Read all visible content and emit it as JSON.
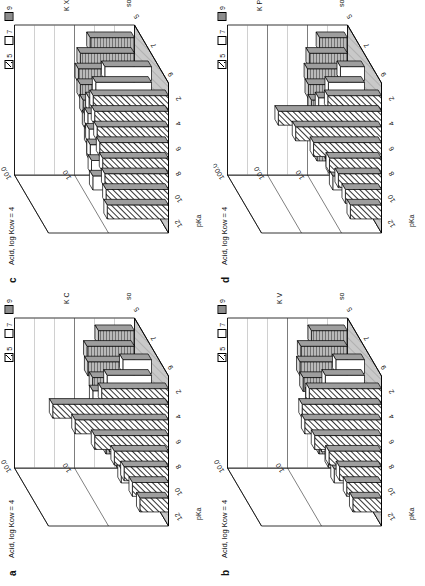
{
  "figure": {
    "rotation_deg": -90,
    "background": "#ffffff",
    "ink": "#111111"
  },
  "legend": {
    "title": "soil pH",
    "items": [
      {
        "label": "5",
        "pattern": "diagonal-hatch",
        "swatch": "#ffffff"
      },
      {
        "label": "7",
        "pattern": "solid-white",
        "swatch": "#ffffff"
      },
      {
        "label": "9",
        "pattern": "horizontal-hatch",
        "swatch": "#d9d9d9"
      }
    ]
  },
  "axes": {
    "pka_label": "pKa",
    "pka_ticks": [
      "12",
      "10",
      "8",
      "6",
      "4",
      "2"
    ],
    "ph_label": "soil pH",
    "ph_ticks": [
      "9",
      "7",
      "5"
    ]
  },
  "panels": [
    {
      "letter": "a",
      "title": "Acid, log Kow = 4",
      "zlabel": "K Cyt-soil",
      "z_ticks": [
        "10.0",
        "1.0",
        "0.1"
      ],
      "chart_data": {
        "type": "bar",
        "title": "Acid, log Kow = 4",
        "xlabel": "pKa",
        "ylabel": "K Cyt-soil",
        "zlabel": "soil pH",
        "categories": [
          "12",
          "10",
          "8",
          "6",
          "4",
          "2"
        ],
        "ylim": [
          0.1,
          10.0
        ],
        "log_scale": true,
        "grid": true,
        "legend_position": "top-right",
        "series": [
          {
            "name": "5",
            "pattern": "diagonal-hatch",
            "values": [
              0.3,
              0.4,
              0.55,
              0.8,
              1.7,
              3.6,
              8.5,
              1.3
            ]
          },
          {
            "name": "7",
            "pattern": "solid-white",
            "values": [
              0.32,
              0.38,
              0.5,
              0.7,
              0.9,
              0.95,
              0.55,
              0.3
            ]
          },
          {
            "name": "9",
            "pattern": "horizontal-hatch",
            "values": [
              0.3,
              0.33,
              0.36,
              0.4,
              0.5,
              0.6,
              0.62,
              0.4
            ]
          }
        ]
      }
    },
    {
      "letter": "b",
      "title": "Acid, log Kow = 4",
      "zlabel": "K Vac-soil",
      "z_ticks": [
        "10.0",
        "1.0",
        "0.1"
      ],
      "chart_data": {
        "type": "bar",
        "title": "Acid, log Kow = 4",
        "xlabel": "pKa",
        "ylabel": "K Vac-soil",
        "zlabel": "soil pH",
        "categories": [
          "12",
          "10",
          "8",
          "6",
          "4",
          "2"
        ],
        "ylim": [
          0.1,
          10.0
        ],
        "log_scale": true,
        "grid": true,
        "legend_position": "top-right",
        "series": [
          {
            "name": "5",
            "pattern": "diagonal-hatch",
            "values": [
              0.3,
              0.38,
              0.5,
              0.75,
              1.3,
              1.9,
              2.1,
              1.6
            ]
          },
          {
            "name": "7",
            "pattern": "solid-white",
            "values": [
              0.32,
              0.4,
              0.52,
              0.68,
              0.8,
              0.75,
              0.45,
              0.3
            ]
          },
          {
            "name": "9",
            "pattern": "horizontal-hatch",
            "values": [
              0.3,
              0.34,
              0.38,
              0.44,
              0.55,
              0.62,
              0.6,
              0.4
            ]
          }
        ]
      }
    },
    {
      "letter": "c",
      "title": "Acid, log Kow = 4",
      "zlabel": "K Xyl-soil",
      "z_ticks": [
        "10.0",
        "1.0",
        "0.1"
      ],
      "chart_data": {
        "type": "bar",
        "title": "Acid, log Kow = 4",
        "xlabel": "pKa",
        "ylabel": "K Xyl-soil",
        "zlabel": "soil pH",
        "categories": [
          "12",
          "10",
          "8",
          "6",
          "4",
          "2"
        ],
        "ylim": [
          0.1,
          10.0
        ],
        "log_scale": true,
        "grid": true,
        "legend_position": "top-right",
        "series": [
          {
            "name": "5",
            "pattern": "diagonal-hatch",
            "values": [
              1.05,
              1.1,
              1.15,
              1.25,
              1.4,
              1.55,
              1.7,
              1.8
            ]
          },
          {
            "name": "7",
            "pattern": "solid-white",
            "values": [
              0.95,
              1.0,
              1.05,
              1.1,
              1.15,
              1.1,
              0.85,
              0.6
            ]
          },
          {
            "name": "9",
            "pattern": "horizontal-hatch",
            "values": [
              0.55,
              0.6,
              0.65,
              0.72,
              0.8,
              0.86,
              0.8,
              0.55
            ]
          }
        ]
      }
    },
    {
      "letter": "d",
      "title": "Acid, log Kow = 4",
      "zlabel": "K Phlo-soil",
      "z_ticks": [
        "100.0",
        "10.0",
        "1.0",
        "0.1"
      ],
      "chart_data": {
        "type": "bar",
        "title": "Acid, log Kow = 4",
        "xlabel": "pKa",
        "ylabel": "K Phlo-soil",
        "zlabel": "soil pH",
        "categories": [
          "12",
          "10",
          "8",
          "6",
          "4",
          "2"
        ],
        "ylim": [
          0.1,
          100.0
        ],
        "log_scale": true,
        "grid": true,
        "legend_position": "top-right",
        "series": [
          {
            "name": "5",
            "pattern": "diagonal-hatch",
            "values": [
              0.6,
              0.8,
              1.2,
              2.0,
              5.0,
              14.0,
              38.0,
              2.2
            ]
          },
          {
            "name": "7",
            "pattern": "solid-white",
            "values": [
              0.62,
              0.75,
              0.95,
              1.2,
              1.45,
              1.4,
              0.8,
              0.4
            ]
          },
          {
            "name": "9",
            "pattern": "horizontal-hatch",
            "values": [
              0.58,
              0.64,
              0.7,
              0.8,
              0.95,
              1.0,
              0.9,
              0.5
            ]
          }
        ]
      }
    }
  ]
}
